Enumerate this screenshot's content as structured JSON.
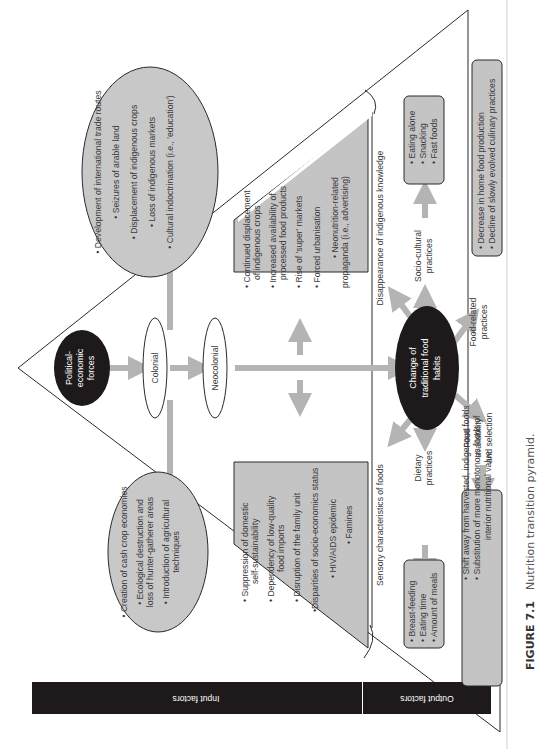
{
  "caption": {
    "figure_label": "FIGURE 7.1",
    "title": "Nutrition transition pyramid."
  },
  "factor_bar": {
    "input_label": "Input factors",
    "output_label": "Output factors"
  },
  "apex": {
    "label_line1": "Political-",
    "label_line2": "economic",
    "label_line3": "forces"
  },
  "eras": {
    "colonial": "Colonial",
    "neocolonial": "Neocolonial"
  },
  "colonial_upper_ellipse": {
    "items": [
      "• Development of international trade routes",
      "• Seizures of arable land",
      "• Displacement of indigenous crops",
      "• Loss of indigenous markets",
      "• Cultural indoctrination (i.e., 'education')"
    ]
  },
  "colonial_lower_ellipse": {
    "items": [
      "• Creation of cash crop economies",
      "• Ecological destruction and",
      "loss of hunter-gatherer areas",
      "• Introduction of agricultural",
      "techniques"
    ]
  },
  "neocolonial_upper_box": {
    "items": [
      "• Continued displacement",
      "of indigenous crops",
      "• Increased availability of",
      "processed food products",
      "• Rise of 'super' markets",
      "• Forced urbanisation",
      "• Neonutrition-related",
      "propaganda (i.e., advertising)"
    ]
  },
  "neocolonial_lower_box": {
    "items": [
      "• Suppression of domestic",
      "self-sustainability",
      "• Dependency of low-quality",
      "food imports",
      "• Disruption of the family unit",
      "•Disparities of socio-economics status",
      "• HIV/AIDS epidemic",
      "• Famines"
    ]
  },
  "center": {
    "label_line1": "Change of",
    "label_line2": "traditional food",
    "label_line3": "habits"
  },
  "outcomes": {
    "disappearance": "Disappearance of indigenous knowledge",
    "sensory": "Sensory characteristics of foods",
    "socio_cultural_line1": "Socio-cultural",
    "socio_cultural_line2": "practices",
    "food_related_line1": "Food-related",
    "food_related_line2": "practices",
    "food_availability_line1": "Food",
    "food_availability_line2": "availability",
    "food_availability_line3": "and selection",
    "dietary_line1": "Dietary",
    "dietary_line2": "practices"
  },
  "outcome_boxes": {
    "socio_cultural": [
      "• Eating alone",
      "• Snacking",
      "• Fast foods"
    ],
    "food_related": [
      "• Decrease in home food production",
      "• Decline of slowly evolved culinary practices"
    ],
    "dietary": [
      "• Breast-feeding",
      "• Eating time",
      "• Amount of meals"
    ],
    "food_availability": [
      "• Shift away from harvested, indigenous foods",
      "• Substitution of more monotonous foods of",
      "interior nutritional value"
    ]
  },
  "colors": {
    "ellipse_fill": "#c8c8c8",
    "box_fill": "#c4c4c4",
    "arrow": "#b4b4b4",
    "dark": "#1e1a1b",
    "line": "#2a2a2a"
  }
}
